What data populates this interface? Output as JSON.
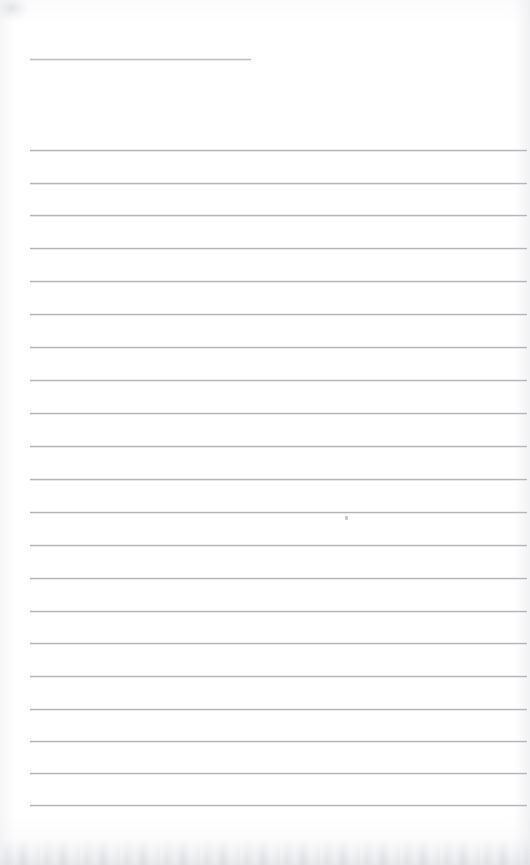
{
  "document": {
    "type": "scanned-blank-ruled-page",
    "title_text": "",
    "body_text": "",
    "page_width": 530,
    "page_height": 865
  },
  "appearance": {
    "paper_color": "#ffffff",
    "rule_color": "#b3b6bb",
    "title_rule_color": "#bcbfc4",
    "edge_shadow_color": "#e4e5e8"
  },
  "title_rule": {
    "name": "title-rule",
    "x": 30,
    "y": 59,
    "width": 221,
    "content": ""
  },
  "rules": [
    {
      "index": 1,
      "y": 150,
      "x": 30,
      "width": 497,
      "content": ""
    },
    {
      "index": 2,
      "y": 183,
      "x": 30,
      "width": 497,
      "content": ""
    },
    {
      "index": 3,
      "y": 215,
      "x": 30,
      "width": 497,
      "content": ""
    },
    {
      "index": 4,
      "y": 248,
      "x": 30,
      "width": 497,
      "content": ""
    },
    {
      "index": 5,
      "y": 281,
      "x": 30,
      "width": 497,
      "content": ""
    },
    {
      "index": 6,
      "y": 314,
      "x": 30,
      "width": 497,
      "content": ""
    },
    {
      "index": 7,
      "y": 347,
      "x": 30,
      "width": 497,
      "content": ""
    },
    {
      "index": 8,
      "y": 380,
      "x": 30,
      "width": 497,
      "content": ""
    },
    {
      "index": 9,
      "y": 413,
      "x": 30,
      "width": 497,
      "content": ""
    },
    {
      "index": 10,
      "y": 446,
      "x": 30,
      "width": 497,
      "content": ""
    },
    {
      "index": 11,
      "y": 479,
      "x": 30,
      "width": 497,
      "content": ""
    },
    {
      "index": 12,
      "y": 512,
      "x": 30,
      "width": 497,
      "content": ""
    },
    {
      "index": 13,
      "y": 545,
      "x": 30,
      "width": 497,
      "content": ""
    },
    {
      "index": 14,
      "y": 578,
      "x": 30,
      "width": 497,
      "content": ""
    },
    {
      "index": 15,
      "y": 611,
      "x": 30,
      "width": 497,
      "content": ""
    },
    {
      "index": 16,
      "y": 643,
      "x": 30,
      "width": 497,
      "content": ""
    },
    {
      "index": 17,
      "y": 676,
      "x": 30,
      "width": 497,
      "content": ""
    },
    {
      "index": 18,
      "y": 709,
      "x": 30,
      "width": 497,
      "content": ""
    },
    {
      "index": 19,
      "y": 741,
      "x": 30,
      "width": 497,
      "content": ""
    },
    {
      "index": 20,
      "y": 773,
      "x": 30,
      "width": 497,
      "content": ""
    },
    {
      "index": 21,
      "y": 805,
      "x": 30,
      "width": 497,
      "content": ""
    }
  ],
  "artifacts": {
    "specks": [
      {
        "name": "ink-speck",
        "x": 345,
        "y": 516
      }
    ]
  }
}
